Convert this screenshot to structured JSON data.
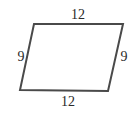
{
  "figure": {
    "shape": "parallelogram",
    "labels": {
      "top": "12",
      "bottom": "12",
      "left": "9",
      "right": "9"
    },
    "colors": {
      "stroke": "#4a4a4a",
      "text": "#2a2a2a",
      "background": "#ffffff"
    }
  }
}
